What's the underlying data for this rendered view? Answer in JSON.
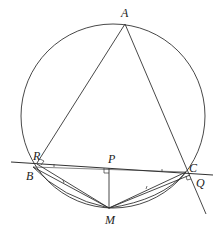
{
  "diagram": {
    "type": "geometry",
    "stroke_color": "#333333",
    "points": {
      "A": {
        "label": "A",
        "x": 125,
        "y": 24
      },
      "B": {
        "label": "B",
        "x": 33,
        "y": 167
      },
      "C": {
        "label": "C",
        "x": 186,
        "y": 172
      },
      "R": {
        "label": "R",
        "x": 37,
        "y": 163
      },
      "P": {
        "label": "P",
        "x": 109,
        "y": 168
      },
      "Q": {
        "label": "Q",
        "x": 191,
        "y": 174
      },
      "M": {
        "label": "M",
        "x": 109,
        "y": 208
      }
    },
    "circle": {
      "cx": 113,
      "cy": 116,
      "r": 92
    },
    "labels": {
      "A": "A",
      "B": "B",
      "C": "C",
      "R": "R",
      "P": "P",
      "Q": "Q",
      "M": "M"
    },
    "right_angles": [
      "P",
      "R",
      "Q"
    ]
  }
}
